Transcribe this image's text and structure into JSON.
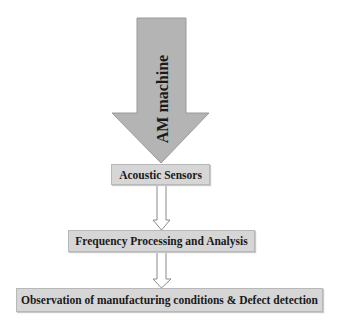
{
  "diagram": {
    "type": "flowchart",
    "direction": "top-to-bottom",
    "nodes": [
      {
        "id": "am_machine",
        "label": "AM machine",
        "shape": "large-down-arrow",
        "fill": "#b4b4b4"
      },
      {
        "id": "acoustic_sensors",
        "label": "Acoustic Sensors",
        "shape": "box",
        "fill": "#d6d6d6"
      },
      {
        "id": "frequency",
        "label": "Frequency Processing and Analysis",
        "shape": "box",
        "fill": "#d6d6d6"
      },
      {
        "id": "observation",
        "label": "Observation of manufacturing conditions & Defect detection",
        "shape": "box",
        "fill": "#d6d6d6"
      }
    ],
    "edges": [
      {
        "from": "am_machine",
        "to": "acoustic_sensors",
        "style": "large-filled-arrow"
      },
      {
        "from": "acoustic_sensors",
        "to": "frequency",
        "style": "hollow-block-arrow"
      },
      {
        "from": "frequency",
        "to": "observation",
        "style": "hollow-block-arrow"
      }
    ]
  }
}
